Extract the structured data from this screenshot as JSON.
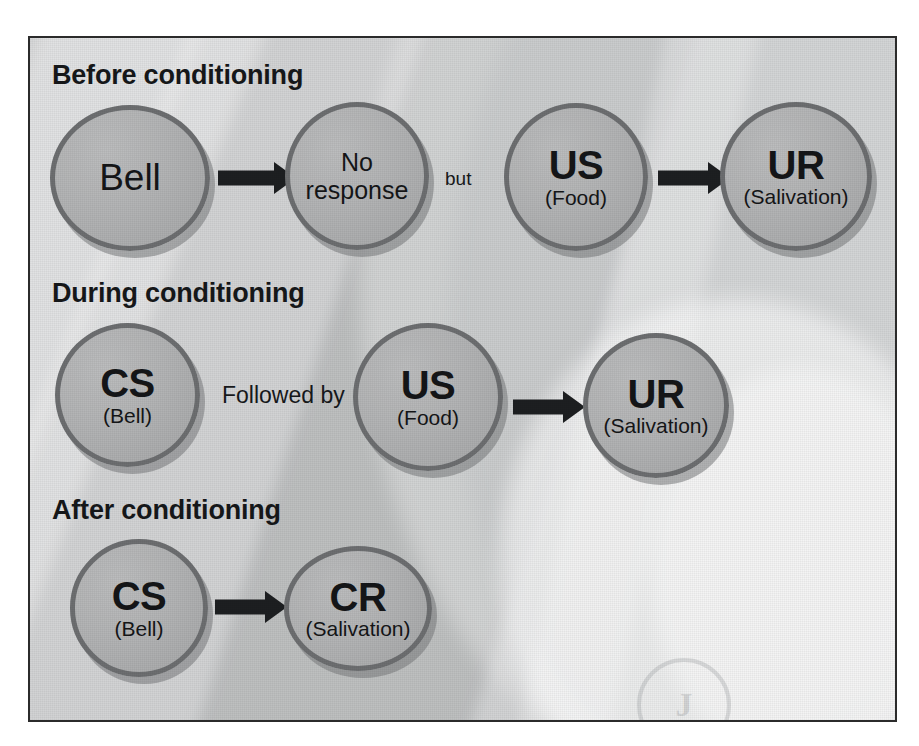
{
  "diagram": {
    "watermark_glyph": "J",
    "colors": {
      "panel_background": "#d2d3d4",
      "panel_border": "#2b2b2b",
      "bubble_fill": "#b2b3b4",
      "bubble_border": "#6d6f71",
      "bubble_shadow": "#787a7c",
      "arrow": "#1d1f21",
      "text": "#16181a"
    },
    "sections": [
      {
        "id": "before",
        "title": "Before conditioning",
        "nodes": [
          {
            "id": "bell",
            "main": "Bell",
            "sub": "",
            "style": "plain"
          },
          {
            "id": "no-response",
            "main": "No response",
            "sub": "",
            "style": "plain-small"
          },
          {
            "id": "us-before",
            "main": "US",
            "sub": "(Food)",
            "style": "acronym"
          },
          {
            "id": "ur-before",
            "main": "UR",
            "sub": "(Salivation)",
            "style": "acronym"
          }
        ],
        "connectors": [
          {
            "id": "arrow-bell-noresponse",
            "kind": "arrow"
          },
          {
            "id": "but-label",
            "kind": "word",
            "label": "but"
          },
          {
            "id": "arrow-us-ur-before",
            "kind": "arrow"
          }
        ]
      },
      {
        "id": "during",
        "title": "During conditioning",
        "nodes": [
          {
            "id": "cs-during",
            "main": "CS",
            "sub": "(Bell)",
            "style": "acronym"
          },
          {
            "id": "us-during",
            "main": "US",
            "sub": "(Food)",
            "style": "acronym"
          },
          {
            "id": "ur-during",
            "main": "UR",
            "sub": "(Salivation)",
            "style": "acronym"
          }
        ],
        "connectors": [
          {
            "id": "followed-by-label",
            "kind": "word",
            "label": "Followed by"
          },
          {
            "id": "arrow-us-ur-during",
            "kind": "arrow"
          }
        ]
      },
      {
        "id": "after",
        "title": "After conditioning",
        "nodes": [
          {
            "id": "cs-after",
            "main": "CS",
            "sub": "(Bell)",
            "style": "acronym"
          },
          {
            "id": "cr-after",
            "main": "CR",
            "sub": "(Salivation)",
            "style": "acronym"
          }
        ],
        "connectors": [
          {
            "id": "arrow-cs-cr-after",
            "kind": "arrow"
          }
        ]
      }
    ]
  }
}
